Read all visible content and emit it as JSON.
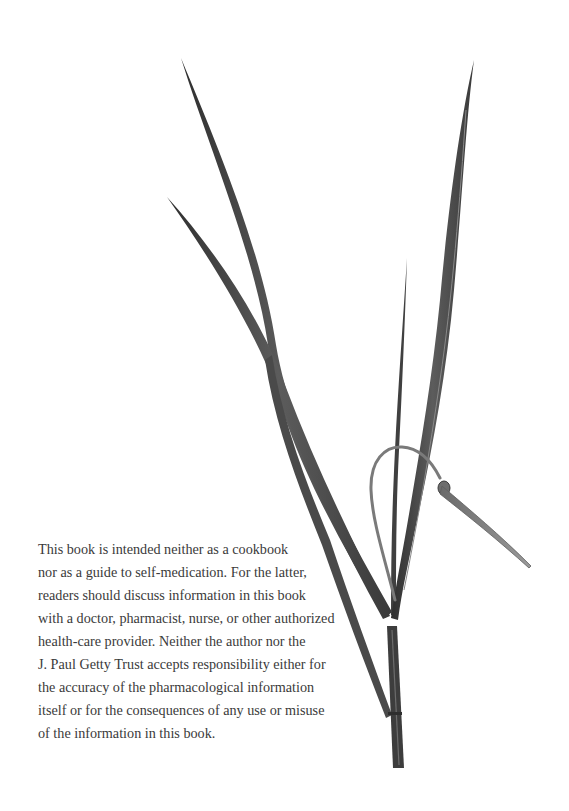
{
  "page": {
    "illustration": {
      "subject": "grass-plant-illustration",
      "colors": {
        "leaf_dark": "#3c3c3c",
        "leaf_mid": "#5a5a5a",
        "leaf_light": "#7a7a7a",
        "background": "#ffffff"
      }
    },
    "disclaimer": {
      "lines": [
        "This book is intended neither as a cookbook",
        "nor as a guide to self-medication. For the latter,",
        "readers should discuss information in this book",
        "with a doctor, pharmacist, nurse, or other authorized",
        "health-care provider. Neither the author nor the",
        "J. Paul Getty Trust accepts responsibility either for",
        "the accuracy of the pharmacological information",
        "itself or for the consequences of any use or misuse",
        "of the information in this book."
      ],
      "text_color": "#3a3a3a"
    }
  }
}
